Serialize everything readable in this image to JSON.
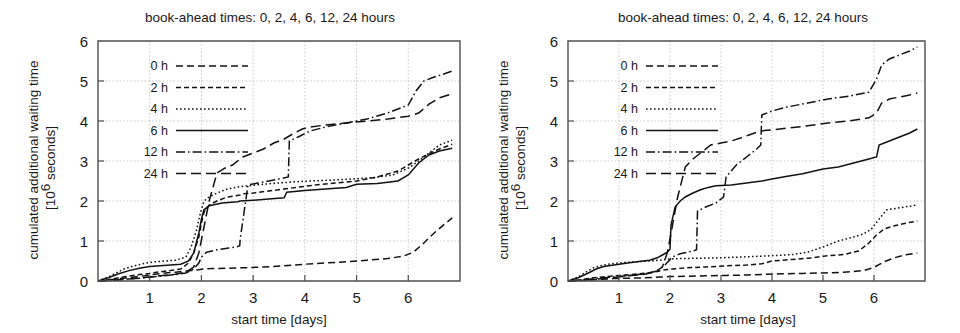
{
  "figure": {
    "panel_count": 2,
    "line_color": "#121212",
    "grid_color": "#b9b9b9",
    "frame_color": "#4f4f4f"
  },
  "chart_data": [
    {
      "type": "line",
      "panel_id": "left",
      "title": "book-ahead times: 0, 2, 4, 6, 12, 24 hours",
      "xlabel": "start time [days]",
      "ylabel_line1": "cumulated additional waiting time",
      "ylabel_line2_pre": "[10",
      "ylabel_line2_sup": "6",
      "ylabel_line2_post": " seconds]",
      "xlim": [
        0,
        7
      ],
      "ylim": [
        0,
        6
      ],
      "xticks": [
        1,
        2,
        3,
        4,
        5,
        6
      ],
      "yticks": [
        0,
        1,
        2,
        3,
        4,
        5,
        6
      ],
      "xtick_labels": [
        "1",
        "2",
        "3",
        "4",
        "5",
        "6"
      ],
      "ytick_labels": [
        "0",
        "1",
        "2",
        "3",
        "4",
        "5",
        "6"
      ],
      "grid": true,
      "legend_position": "upper left",
      "series": [
        {
          "name": "0 h",
          "dash": "7,4",
          "x": [
            0.0,
            0.2,
            0.35,
            0.5,
            0.7,
            0.9,
            1.1,
            1.3,
            1.5,
            1.65,
            1.8,
            1.95,
            2.05,
            2.2,
            2.5,
            2.8,
            3.2,
            3.6,
            4.0,
            4.4,
            4.8,
            5.2,
            5.6,
            5.9,
            6.1,
            6.3,
            6.5,
            6.7,
            6.85
          ],
          "y": [
            0.0,
            0.02,
            0.05,
            0.07,
            0.1,
            0.13,
            0.17,
            0.2,
            0.22,
            0.24,
            0.26,
            0.28,
            0.3,
            0.31,
            0.32,
            0.33,
            0.35,
            0.38,
            0.42,
            0.45,
            0.48,
            0.52,
            0.56,
            0.62,
            0.72,
            0.95,
            1.2,
            1.42,
            1.58
          ]
        },
        {
          "name": "2 h",
          "dash": "5,3",
          "x": [
            0.0,
            0.2,
            0.4,
            0.6,
            0.8,
            1.0,
            1.2,
            1.4,
            1.6,
            1.75,
            1.85,
            1.95,
            2.0,
            2.05,
            2.15,
            2.3,
            2.5,
            2.75,
            2.8,
            3.0,
            3.3,
            3.6,
            3.9,
            4.2,
            4.6,
            5.0,
            5.4,
            5.8,
            6.0,
            6.2,
            6.4,
            6.6,
            6.85
          ],
          "y": [
            0.0,
            0.03,
            0.08,
            0.12,
            0.16,
            0.19,
            0.23,
            0.26,
            0.3,
            0.45,
            0.7,
            1.1,
            1.45,
            1.72,
            1.9,
            2.0,
            2.1,
            2.15,
            2.18,
            2.2,
            2.25,
            2.3,
            2.35,
            2.4,
            2.45,
            2.5,
            2.6,
            2.75,
            2.9,
            3.05,
            3.18,
            3.3,
            3.42
          ]
        },
        {
          "name": "4 h",
          "dash": "1.6,2.4",
          "x": [
            0.0,
            0.2,
            0.35,
            0.5,
            0.7,
            0.9,
            1.1,
            1.3,
            1.5,
            1.7,
            1.8,
            1.9,
            1.98,
            2.05,
            2.15,
            2.3,
            2.5,
            2.7,
            2.9,
            3.2,
            3.5,
            3.8,
            4.1,
            4.5,
            4.9,
            5.3,
            5.7,
            6.0,
            6.2,
            6.4,
            6.6,
            6.85
          ],
          "y": [
            0.0,
            0.1,
            0.2,
            0.3,
            0.38,
            0.44,
            0.48,
            0.5,
            0.52,
            0.6,
            0.85,
            1.25,
            1.7,
            2.0,
            2.1,
            2.2,
            2.3,
            2.35,
            2.38,
            2.42,
            2.45,
            2.48,
            2.5,
            2.52,
            2.55,
            2.58,
            2.65,
            2.82,
            3.0,
            3.2,
            3.4,
            3.52
          ]
        },
        {
          "name": "6 h",
          "dash": "none",
          "x": [
            0.0,
            0.2,
            0.4,
            0.6,
            0.8,
            1.0,
            1.2,
            1.4,
            1.6,
            1.75,
            1.85,
            1.95,
            2.0,
            2.05,
            2.15,
            2.4,
            2.7,
            2.75,
            3.0,
            3.3,
            3.6,
            3.65,
            4.0,
            4.4,
            4.8,
            5.0,
            5.4,
            5.8,
            6.0,
            6.2,
            6.4,
            6.6,
            6.85
          ],
          "y": [
            0.0,
            0.08,
            0.18,
            0.26,
            0.32,
            0.36,
            0.38,
            0.4,
            0.42,
            0.5,
            0.7,
            1.2,
            1.55,
            1.78,
            1.88,
            1.95,
            1.98,
            2.0,
            2.02,
            2.05,
            2.08,
            2.22,
            2.26,
            2.3,
            2.34,
            2.42,
            2.44,
            2.5,
            2.65,
            2.95,
            3.15,
            3.25,
            3.32
          ]
        },
        {
          "name": "12 h",
          "dash": "9,3,1.6,3",
          "x": [
            0.0,
            0.3,
            0.6,
            0.9,
            1.2,
            1.5,
            1.7,
            1.85,
            1.95,
            2.0,
            2.1,
            2.3,
            2.5,
            2.7,
            2.74,
            2.75,
            2.9,
            3.1,
            3.3,
            3.5,
            3.68,
            3.7,
            3.9,
            4.1,
            4.4,
            4.8,
            5.2,
            5.6,
            6.0,
            6.15,
            6.3,
            6.5,
            6.7,
            6.85
          ],
          "y": [
            0.0,
            0.02,
            0.05,
            0.08,
            0.12,
            0.16,
            0.2,
            0.3,
            0.45,
            0.6,
            0.72,
            0.78,
            0.82,
            0.86,
            0.88,
            1.05,
            2.4,
            2.45,
            2.5,
            2.55,
            2.6,
            3.5,
            3.62,
            3.75,
            3.85,
            3.95,
            4.05,
            4.2,
            4.4,
            4.75,
            5.0,
            5.1,
            5.18,
            5.25
          ]
        },
        {
          "name": "24 h",
          "dash": "10,5",
          "x": [
            0.0,
            0.3,
            0.6,
            0.9,
            1.2,
            1.5,
            1.7,
            1.85,
            1.95,
            2.05,
            2.15,
            2.3,
            2.45,
            2.6,
            2.8,
            3.0,
            3.2,
            3.4,
            3.6,
            3.8,
            3.95,
            4.1,
            4.4,
            4.8,
            5.2,
            5.6,
            6.0,
            6.2,
            6.4,
            6.6,
            6.85
          ],
          "y": [
            0.0,
            0.02,
            0.05,
            0.09,
            0.13,
            0.17,
            0.22,
            0.35,
            0.7,
            1.35,
            2.0,
            2.7,
            2.82,
            2.9,
            3.1,
            3.2,
            3.3,
            3.45,
            3.55,
            3.7,
            3.8,
            3.85,
            3.9,
            3.95,
            4.0,
            4.05,
            4.12,
            4.2,
            4.42,
            4.58,
            4.68
          ]
        }
      ]
    },
    {
      "type": "line",
      "panel_id": "right",
      "title": "book-ahead times: 0, 2, 4, 6, 12, 24 hours",
      "xlabel": "start time [days]",
      "ylabel_line1": "cumulated additional waiting time",
      "ylabel_line2_pre": "[10",
      "ylabel_line2_sup": "6",
      "ylabel_line2_post": " seconds]",
      "xlim": [
        0,
        7
      ],
      "ylim": [
        0,
        6
      ],
      "xticks": [
        1,
        2,
        3,
        4,
        5,
        6
      ],
      "yticks": [
        0,
        1,
        2,
        3,
        4,
        5,
        6
      ],
      "xtick_labels": [
        "1",
        "2",
        "3",
        "4",
        "5",
        "6"
      ],
      "ytick_labels": [
        "0",
        "1",
        "2",
        "3",
        "4",
        "5",
        "6"
      ],
      "grid": true,
      "legend_position": "upper left",
      "series": [
        {
          "name": "0 h",
          "dash": "7,4",
          "x": [
            0.0,
            0.3,
            0.6,
            0.9,
            1.2,
            1.5,
            1.8,
            2.0,
            2.3,
            2.7,
            3.1,
            3.5,
            3.9,
            4.2,
            4.6,
            5.0,
            5.4,
            5.8,
            6.0,
            6.2,
            6.4,
            6.6,
            6.85
          ],
          "y": [
            0.0,
            0.02,
            0.04,
            0.06,
            0.07,
            0.08,
            0.1,
            0.11,
            0.12,
            0.13,
            0.14,
            0.15,
            0.17,
            0.18,
            0.19,
            0.2,
            0.22,
            0.26,
            0.34,
            0.48,
            0.58,
            0.65,
            0.7
          ]
        },
        {
          "name": "2 h",
          "dash": "5,3",
          "x": [
            0.0,
            0.25,
            0.5,
            0.75,
            1.0,
            1.3,
            1.55,
            1.75,
            1.9,
            2.05,
            2.3,
            2.7,
            3.1,
            3.5,
            3.8,
            4.0,
            4.4,
            4.8,
            5.0,
            5.4,
            5.7,
            5.9,
            6.05,
            6.2,
            6.4,
            6.6,
            6.85
          ],
          "y": [
            0.0,
            0.03,
            0.08,
            0.11,
            0.14,
            0.17,
            0.2,
            0.24,
            0.28,
            0.3,
            0.33,
            0.35,
            0.38,
            0.4,
            0.43,
            0.5,
            0.54,
            0.58,
            0.62,
            0.66,
            0.75,
            0.95,
            1.15,
            1.3,
            1.38,
            1.44,
            1.5
          ]
        },
        {
          "name": "4 h",
          "dash": "1.6,2.4",
          "x": [
            0.0,
            0.2,
            0.35,
            0.5,
            0.7,
            0.9,
            1.1,
            1.35,
            1.6,
            1.8,
            2.0,
            2.2,
            2.6,
            3.0,
            3.4,
            3.8,
            4.1,
            4.4,
            4.7,
            5.0,
            5.3,
            5.6,
            5.8,
            5.95,
            6.1,
            6.25,
            6.45,
            6.65,
            6.85
          ],
          "y": [
            0.0,
            0.1,
            0.22,
            0.33,
            0.4,
            0.44,
            0.46,
            0.48,
            0.5,
            0.52,
            0.55,
            0.56,
            0.57,
            0.58,
            0.6,
            0.62,
            0.64,
            0.66,
            0.72,
            0.85,
            1.0,
            1.1,
            1.18,
            1.3,
            1.55,
            1.78,
            1.82,
            1.86,
            1.9
          ]
        },
        {
          "name": "6 h",
          "dash": "none",
          "x": [
            0.0,
            0.2,
            0.4,
            0.55,
            0.7,
            0.9,
            1.1,
            1.35,
            1.6,
            1.75,
            1.85,
            1.95,
            2.0,
            2.02,
            2.1,
            2.2,
            2.3,
            2.45,
            2.6,
            2.75,
            2.9,
            3.2,
            3.5,
            3.8,
            4.0,
            4.3,
            4.6,
            5.0,
            5.3,
            5.6,
            5.9,
            6.05,
            6.1,
            6.3,
            6.5,
            6.7,
            6.85
          ],
          "y": [
            0.0,
            0.08,
            0.2,
            0.3,
            0.36,
            0.4,
            0.44,
            0.48,
            0.52,
            0.58,
            0.65,
            0.72,
            0.8,
            1.4,
            1.85,
            2.0,
            2.1,
            2.2,
            2.28,
            2.34,
            2.38,
            2.4,
            2.45,
            2.5,
            2.55,
            2.62,
            2.68,
            2.8,
            2.85,
            2.95,
            3.05,
            3.1,
            3.4,
            3.5,
            3.6,
            3.7,
            3.8
          ]
        },
        {
          "name": "12 h",
          "dash": "9,3,1.6,3",
          "x": [
            0.0,
            0.3,
            0.6,
            0.9,
            1.2,
            1.5,
            1.75,
            1.9,
            2.05,
            2.2,
            2.35,
            2.45,
            2.52,
            2.54,
            2.7,
            2.9,
            3.05,
            3.1,
            3.3,
            3.5,
            3.7,
            3.78,
            3.8,
            4.0,
            4.3,
            4.7,
            5.1,
            5.5,
            5.9,
            6.05,
            6.15,
            6.3,
            6.5,
            6.7,
            6.85
          ],
          "y": [
            0.0,
            0.03,
            0.07,
            0.1,
            0.14,
            0.18,
            0.25,
            0.4,
            0.6,
            0.68,
            0.72,
            0.75,
            0.78,
            1.75,
            1.85,
            1.95,
            2.1,
            2.6,
            2.9,
            3.1,
            3.3,
            3.4,
            4.15,
            4.25,
            4.35,
            4.45,
            4.55,
            4.62,
            4.72,
            5.05,
            5.4,
            5.55,
            5.65,
            5.75,
            5.85
          ]
        },
        {
          "name": "24 h",
          "dash": "10,5",
          "x": [
            0.0,
            0.3,
            0.6,
            0.9,
            1.2,
            1.5,
            1.7,
            1.85,
            1.95,
            2.05,
            2.15,
            2.3,
            2.45,
            2.6,
            2.8,
            3.0,
            3.2,
            3.4,
            3.55,
            3.7,
            3.85,
            4.0,
            4.3,
            4.7,
            5.1,
            5.5,
            5.9,
            6.05,
            6.15,
            6.3,
            6.5,
            6.7,
            6.85
          ],
          "y": [
            0.0,
            0.02,
            0.05,
            0.09,
            0.13,
            0.17,
            0.22,
            0.35,
            0.72,
            1.4,
            2.1,
            2.85,
            3.05,
            3.2,
            3.4,
            3.45,
            3.5,
            3.58,
            3.65,
            3.72,
            3.76,
            3.78,
            3.82,
            3.88,
            3.95,
            4.0,
            4.08,
            4.2,
            4.45,
            4.55,
            4.6,
            4.65,
            4.7
          ]
        }
      ]
    }
  ]
}
